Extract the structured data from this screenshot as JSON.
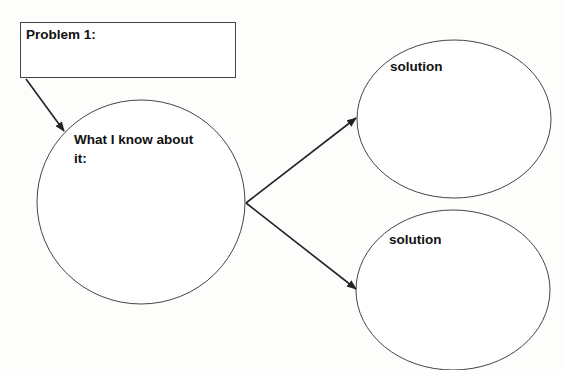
{
  "diagram": {
    "problem": {
      "label": "Problem 1:"
    },
    "known": {
      "label_line1": "What I know about",
      "label_line2": "it:"
    },
    "solutions": [
      {
        "label": "solution"
      },
      {
        "label": "solution"
      }
    ],
    "colors": {
      "stroke": "#333333",
      "background": "#fdfdfb",
      "text": "#111111"
    }
  }
}
